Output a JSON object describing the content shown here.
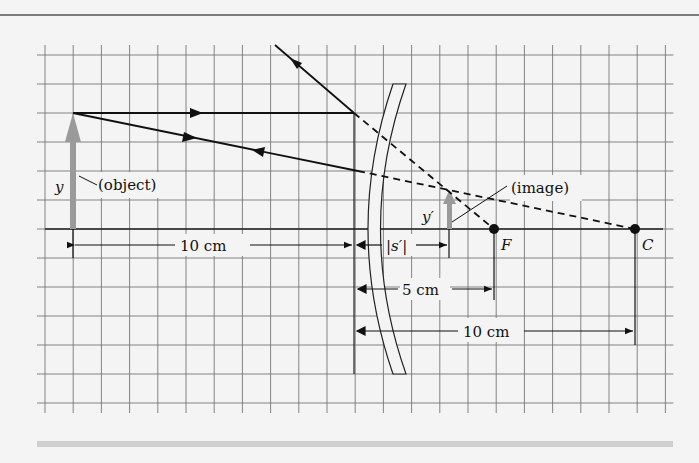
{
  "diagram": {
    "type": "convex-mirror-ray-diagram",
    "labels": {
      "object": "(object)",
      "image": "(image)",
      "object_height": "y",
      "image_height": "y′",
      "focal_point": "F",
      "center_of_curvature": "C",
      "image_distance": "|s′|",
      "object_distance": "10 cm",
      "focal_length": "5 cm",
      "radius": "10 cm"
    },
    "grid": {
      "columns": 22,
      "rows": 12,
      "x_start": 45,
      "x_step": 28.2,
      "y_start": 55,
      "y_step": 29,
      "line_color": "#777777"
    },
    "colors": {
      "background": "#f4f4f4",
      "ray": "#111111",
      "object_arrow": "#9a9a9a",
      "rule": "#555555",
      "bottom_band": "#cfcfcf"
    }
  }
}
